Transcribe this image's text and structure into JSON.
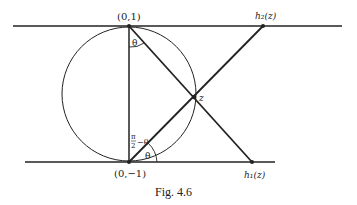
{
  "figure": {
    "caption": "Fig. 4.6",
    "labels": {
      "top_point": "(0,1)",
      "bottom_point": "(0,−1)",
      "z": "z",
      "h2": "h₂(z)",
      "h1": "h₁(z)",
      "theta_top": "θ",
      "theta_bottom": "θ",
      "pi_over_2": "π",
      "pi_denominator": "2",
      "minus_theta": "−θ"
    },
    "colors": {
      "ink": "#222222",
      "background": "#ffffff"
    }
  }
}
